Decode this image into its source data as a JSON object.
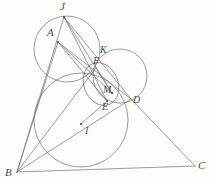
{
  "figure": {
    "kind": "euclidean-geometry-diagram",
    "width": 216,
    "height": 184,
    "background_color": "#fdfdfc",
    "stroke_color": "#6e6e70",
    "label_color": "#4a4a4a"
  },
  "labels": {
    "J": "J",
    "A": "A",
    "K": "K",
    "F": "F",
    "M": "M",
    "E": "E",
    "D": "D",
    "I": "I",
    "B": "B",
    "C": "C"
  },
  "points": [
    {
      "id": "J",
      "label": "J",
      "x": 64,
      "y": 17,
      "label_x": 62,
      "label_y": 2,
      "dot": true
    },
    {
      "id": "A",
      "label": "A",
      "x": 58,
      "y": 42,
      "label_x": 48,
      "label_y": 28,
      "dot": true
    },
    {
      "id": "K",
      "label": "K",
      "x": 101,
      "y": 61,
      "label_x": 101,
      "label_y": 46,
      "dot": false
    },
    {
      "id": "F",
      "label": "F",
      "x": 96,
      "y": 68,
      "label_x": 94,
      "label_y": 57,
      "dot": false
    },
    {
      "id": "M",
      "label": "M",
      "x": 112,
      "y": 93,
      "label_x": 104,
      "label_y": 87,
      "dot": true
    },
    {
      "id": "E",
      "label": "E",
      "x": 107,
      "y": 101,
      "label_x": 103,
      "label_y": 103,
      "dot": true
    },
    {
      "id": "D",
      "label": "D",
      "x": 131,
      "y": 99,
      "label_x": 132,
      "label_y": 96,
      "dot": false
    },
    {
      "id": "I",
      "label": "I",
      "x": 81,
      "y": 124,
      "label_x": 84,
      "label_y": 127,
      "dot": true
    },
    {
      "id": "B",
      "label": "B",
      "x": 17,
      "y": 172,
      "label_x": 6,
      "label_y": 168,
      "dot": false
    },
    {
      "id": "C",
      "label": "C",
      "x": 195,
      "y": 166,
      "label_x": 197,
      "label_y": 161,
      "dot": false
    }
  ],
  "circles": [
    {
      "id": "incircle",
      "cx": 81,
      "cy": 120,
      "r": 47
    },
    {
      "id": "circle-top",
      "cx": 67,
      "cy": 49,
      "r": 33
    },
    {
      "id": "circle-right",
      "cx": 120,
      "cy": 76,
      "r": 27
    },
    {
      "id": "circle-small",
      "cx": 101,
      "cy": 84,
      "r": 22
    }
  ],
  "segments": [
    {
      "id": "AB",
      "from": "A",
      "to": "B"
    },
    {
      "id": "BC",
      "from": "B",
      "to": "C"
    },
    {
      "id": "BJ",
      "from": "B",
      "to": "J"
    },
    {
      "id": "BD",
      "from": "B",
      "to": "D"
    },
    {
      "id": "AD",
      "from": "A",
      "to": "D"
    },
    {
      "id": "AM",
      "from": "A",
      "to": "M"
    },
    {
      "id": "AE",
      "from": "A",
      "to": "E"
    },
    {
      "id": "JD",
      "from": "J",
      "to": "D"
    },
    {
      "id": "JE",
      "from": "J",
      "to": "E"
    },
    {
      "id": "JM",
      "from": "J",
      "to": "M"
    },
    {
      "id": "DC",
      "from": "D",
      "to": "C"
    },
    {
      "id": "EC",
      "from": "E",
      "to": "C"
    },
    {
      "id": "BI",
      "from": "B",
      "to": "I"
    },
    {
      "id": "IE",
      "from": "I",
      "to": "E"
    },
    {
      "id": "FM",
      "from": "F",
      "to": "M"
    },
    {
      "id": "BF",
      "from": "B",
      "to": "F"
    }
  ]
}
